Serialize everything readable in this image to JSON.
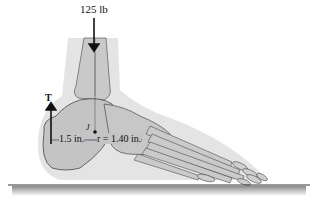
{
  "diagram": {
    "forces": {
      "weight": {
        "label": "125 lb",
        "direction": "down"
      },
      "tension": {
        "label": "T",
        "direction": "up"
      }
    },
    "dimensions": {
      "left": {
        "label": "1.5 in."
      },
      "right": {
        "label": "r = 1.40 in."
      }
    },
    "joint": {
      "label": "J"
    },
    "ground": {
      "label": "floor"
    },
    "colors": {
      "bone_fill": "#c8c8c8",
      "soft_tissue": "#e2e2e2",
      "outline": "#333333",
      "arrow": "#111111"
    }
  }
}
